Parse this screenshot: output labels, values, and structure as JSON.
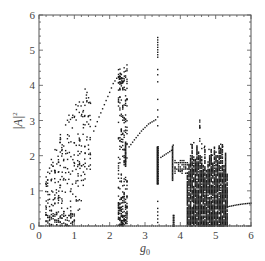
{
  "chart_data": {
    "type": "scatter",
    "title": "",
    "xlabel": "g0",
    "xlabel_main": "g",
    "xlabel_sub": "0",
    "ylabel": "|A|^2",
    "ylabel_main": "|A|",
    "ylabel_sup": "2",
    "xlim": [
      0,
      6
    ],
    "ylim": [
      0,
      6
    ],
    "xticks": [
      "0",
      "1",
      "2",
      "3",
      "4",
      "5",
      "6"
    ],
    "yticks": [
      "0",
      "1",
      "2",
      "3",
      "4",
      "5",
      "6"
    ],
    "grid": false,
    "legend": null,
    "marker_color": "#1a1a1a",
    "regions": [
      {
        "name": "chaotic-band-1",
        "x_range": [
          0.2,
          1.5
        ],
        "y_min_edge": [
          [
            0.2,
            0.0
          ],
          [
            1.0,
            0.0
          ],
          [
            1.5,
            1.5
          ]
        ],
        "y_max_edge": [
          [
            0.2,
            1.4
          ],
          [
            0.5,
            2.4
          ],
          [
            1.0,
            3.5
          ],
          [
            1.3,
            3.9
          ],
          [
            1.5,
            3.6
          ]
        ]
      },
      {
        "name": "periodic-branch-1",
        "points": [
          [
            1.55,
            2.7
          ],
          [
            1.7,
            3.1
          ],
          [
            1.85,
            3.45
          ],
          [
            2.0,
            3.8
          ],
          [
            2.1,
            4.05
          ],
          [
            2.2,
            4.2
          ],
          [
            2.3,
            4.25
          ]
        ]
      },
      {
        "name": "chaotic-window-2",
        "x_range": [
          2.25,
          2.5
        ],
        "y_range": [
          0.0,
          4.6
        ]
      },
      {
        "name": "periodic-segment-2a",
        "points": [
          [
            2.45,
            1.7
          ],
          [
            2.45,
            2.4
          ]
        ]
      },
      {
        "name": "periodic-branch-2",
        "points": [
          [
            2.55,
            2.25
          ],
          [
            2.7,
            2.45
          ],
          [
            2.9,
            2.7
          ],
          [
            3.1,
            2.9
          ],
          [
            3.3,
            3.02
          ]
        ]
      },
      {
        "name": "chaotic-window-3",
        "x_range": [
          3.33,
          3.4
        ],
        "y_range": [
          0.0,
          5.4
        ]
      },
      {
        "name": "periodic-segment-3a",
        "points": [
          [
            3.35,
            1.2
          ],
          [
            3.35,
            2.25
          ]
        ]
      },
      {
        "name": "periodic-branch-3",
        "points": [
          [
            3.45,
            1.95
          ],
          [
            3.6,
            2.05
          ],
          [
            3.75,
            2.15
          ],
          [
            3.8,
            2.3
          ]
        ]
      },
      {
        "name": "periodic-branch-4",
        "points": [
          [
            3.85,
            1.65
          ],
          [
            4.0,
            1.55
          ],
          [
            4.15,
            1.65
          ]
        ]
      },
      {
        "name": "chaotic-band-5",
        "x_range": [
          4.2,
          5.35
        ],
        "y_range": [
          0.0,
          2.4
        ],
        "outliers_max": 3.05
      },
      {
        "name": "fixed-point-branch",
        "points": [
          [
            5.35,
            0.55
          ],
          [
            5.6,
            0.6
          ],
          [
            5.8,
            0.63
          ],
          [
            6.0,
            0.65
          ]
        ]
      },
      {
        "name": "zero-branch",
        "points": [
          [
            0.0,
            0.0
          ],
          [
            6.0,
            0.0
          ]
        ]
      }
    ]
  }
}
